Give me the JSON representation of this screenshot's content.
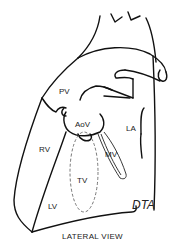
{
  "figure": {
    "caption": "LATERAL VIEW",
    "handwritten_label": "DTA",
    "structure_labels": {
      "pv": "PV",
      "aov": "AoV",
      "la": "LA",
      "rv": "RV",
      "mv": "MV",
      "tv": "TV",
      "lv": "LV"
    }
  }
}
